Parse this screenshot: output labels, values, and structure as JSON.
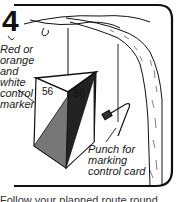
{
  "panel": {
    "step_number": "4",
    "labels": {
      "marker": [
        "Red or",
        "orange",
        "and white",
        "control",
        "marker"
      ],
      "punch": [
        "Punch for",
        "marking",
        "control card"
      ]
    },
    "marker_numbers": [
      "56",
      "56"
    ],
    "caption": "Follow your planned route round"
  },
  "colors": {
    "ink": "#111111",
    "background": "#ffffff"
  }
}
